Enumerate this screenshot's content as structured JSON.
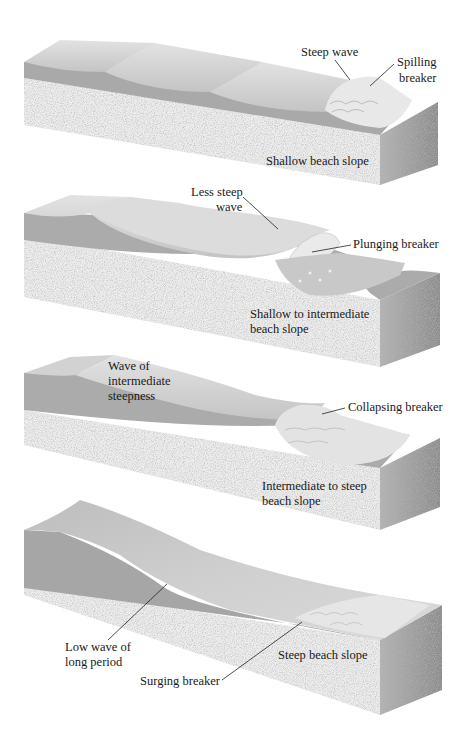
{
  "diagram": {
    "type": "breaker-types-by-beach-slope",
    "panels": [
      {
        "id": "spilling",
        "wave_label": "Steep wave",
        "breaker_label_line1": "Spilling",
        "breaker_label_line2": "breaker",
        "slope_label_line1": "Shallow beach slope",
        "slope_label_line2": ""
      },
      {
        "id": "plunging",
        "wave_label_line1": "Less steep",
        "wave_label_line2": "wave",
        "breaker_label": "Plunging breaker",
        "slope_label_line1": "Shallow to intermediate",
        "slope_label_line2": "beach slope"
      },
      {
        "id": "collapsing",
        "wave_label_line1": "Wave of",
        "wave_label_line2": "intermediate",
        "wave_label_line3": "steepness",
        "breaker_label": "Collapsing breaker",
        "slope_label_line1": "Intermediate to steep",
        "slope_label_line2": "beach slope"
      },
      {
        "id": "surging",
        "wave_label_line1": "Low wave of",
        "wave_label_line2": "long period",
        "breaker_label": "Surging breaker",
        "slope_label_line1": "Steep beach slope",
        "slope_label_line2": ""
      }
    ],
    "colors": {
      "water_top": "#d6d6d6",
      "water_face": "#a8a8a8",
      "sand_front": "#efefef",
      "sand_side": "#9a9a9a",
      "foam": "#f4f4f4",
      "leader_line": "#222222"
    }
  }
}
